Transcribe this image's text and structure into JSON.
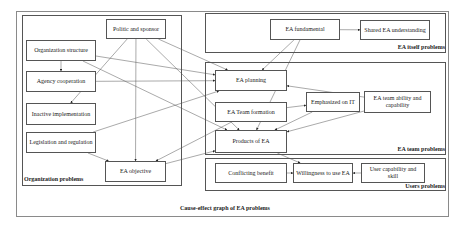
{
  "caption": "Cause-effect graph of EA problems",
  "groups": {
    "organization": "Organization problems",
    "ea_itself": "EA itself problems",
    "ea_team": "EA team problems",
    "users": "Users problems"
  },
  "nodes": {
    "politic_sponsor": "Politic and sponsor",
    "org_structure": "Organization structure",
    "agency_cooperation": "Agency cooperation",
    "inactive_implementation": "Inactive implementation",
    "legislation_regulation": "Legislation and regulation",
    "ea_objective": "EA objective",
    "ea_fundamental": "EA fundamental",
    "shared_ea_understanding": "Shared EA understanding",
    "ea_planning": "EA planning",
    "ea_team_formation": "EA Team formation",
    "emphasized_it": "Emphasized on IT",
    "ea_team_ability": "EA team ability and capability",
    "products_of_ea": "Products of EA",
    "conflicting_benefit": "Conflicting benefit",
    "willingness_use_ea": "Willingness to use EA",
    "user_capability_skill": "User capability and skill"
  },
  "edges": [
    {
      "from": "org_structure",
      "to": "agency_cooperation"
    },
    {
      "from": "org_structure",
      "to": "ea_planning"
    },
    {
      "from": "org_structure",
      "to": "products_of_ea"
    },
    {
      "from": "agency_cooperation",
      "to": "ea_planning"
    },
    {
      "from": "politic_sponsor",
      "to": "inactive_implementation"
    },
    {
      "from": "politic_sponsor",
      "to": "ea_planning"
    },
    {
      "from": "politic_sponsor",
      "to": "ea_objective"
    },
    {
      "from": "politic_sponsor",
      "to": "products_of_ea"
    },
    {
      "from": "legislation_regulation",
      "to": "ea_planning"
    },
    {
      "from": "legislation_regulation",
      "to": "ea_objective"
    },
    {
      "from": "ea_objective",
      "to": "products_of_ea"
    },
    {
      "from": "ea_team_formation",
      "to": "ea_objective"
    },
    {
      "from": "ea_fundamental",
      "to": "shared_ea_understanding"
    },
    {
      "from": "ea_fundamental",
      "to": "ea_planning"
    },
    {
      "from": "ea_fundamental",
      "to": "products_of_ea"
    },
    {
      "from": "ea_team_ability",
      "to": "ea_planning"
    },
    {
      "from": "ea_team_ability",
      "to": "products_of_ea"
    },
    {
      "from": "ea_team_formation",
      "to": "emphasized_it"
    },
    {
      "from": "emphasized_it",
      "to": "products_of_ea"
    },
    {
      "from": "products_of_ea",
      "to": "willingness_use_ea"
    },
    {
      "from": "conflicting_benefit",
      "to": "willingness_use_ea"
    },
    {
      "from": "user_capability_skill",
      "to": "willingness_use_ea"
    }
  ]
}
